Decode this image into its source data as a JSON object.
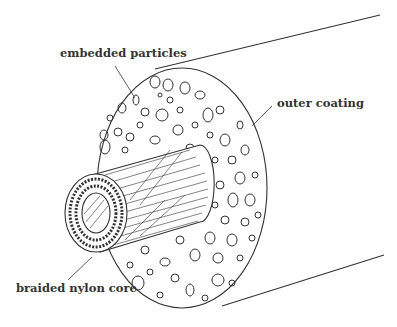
{
  "diagram": {
    "labels": {
      "embedded_particles": "embedded particles",
      "outer_coating": "outer coating",
      "braided_core": "braided nylon core"
    },
    "colors": {
      "stroke": "#333333",
      "background": "#ffffff"
    }
  }
}
